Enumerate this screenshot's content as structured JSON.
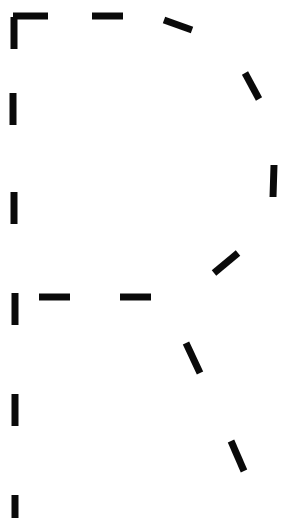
{
  "glyph": {
    "letter": "R",
    "style": "dashed-outline",
    "stroke_color": "#0a0a0a",
    "background_color": "#ffffff",
    "segments": [
      {
        "id": "corner-v",
        "x1": 14,
        "y1": 49,
        "x2": 14,
        "y2": 17
      },
      {
        "id": "corner-h",
        "x1": 13,
        "y1": 16,
        "x2": 48,
        "y2": 16
      },
      {
        "id": "top-dash",
        "x1": 92,
        "y1": 16,
        "x2": 123,
        "y2": 16
      },
      {
        "id": "bowl-1",
        "x1": 164,
        "y1": 20,
        "x2": 192,
        "y2": 30
      },
      {
        "id": "bowl-2",
        "x1": 245,
        "y1": 73,
        "x2": 259,
        "y2": 99
      },
      {
        "id": "bowl-3",
        "x1": 274,
        "y1": 165,
        "x2": 273,
        "y2": 197
      },
      {
        "id": "bowl-4",
        "x1": 238,
        "y1": 253,
        "x2": 214,
        "y2": 273
      },
      {
        "id": "stem-1",
        "x1": 13,
        "y1": 93,
        "x2": 13,
        "y2": 125
      },
      {
        "id": "stem-2",
        "x1": 14,
        "y1": 192,
        "x2": 14,
        "y2": 224
      },
      {
        "id": "stem-3",
        "x1": 15,
        "y1": 293,
        "x2": 15,
        "y2": 325
      },
      {
        "id": "stem-4",
        "x1": 15,
        "y1": 394,
        "x2": 15,
        "y2": 426
      },
      {
        "id": "stem-5",
        "x1": 15,
        "y1": 495,
        "x2": 15,
        "y2": 518
      },
      {
        "id": "bar-1",
        "x1": 39,
        "y1": 297,
        "x2": 70,
        "y2": 297
      },
      {
        "id": "bar-2",
        "x1": 120,
        "y1": 297,
        "x2": 151,
        "y2": 297
      },
      {
        "id": "leg-1",
        "x1": 186,
        "y1": 343,
        "x2": 200,
        "y2": 373
      },
      {
        "id": "leg-2",
        "x1": 231,
        "y1": 441,
        "x2": 244,
        "y2": 471
      }
    ]
  }
}
